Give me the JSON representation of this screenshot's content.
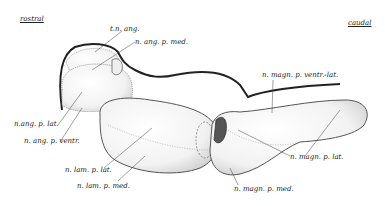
{
  "orientation": {
    "rostral": "rostral",
    "caudal": "caudal"
  },
  "labels": {
    "tn_ang": "t.n. ang.",
    "n_ang_p_med": "n. ang. p. med.",
    "n_ang_p_lat": "n.ang. p. lat.",
    "n_ang_p_ventr": "n. ang. p. ventr.",
    "n_lam_p_lat": "n. lam. p. lat.",
    "n_lam_p_med": "n. lam. p. med.",
    "n_magn_p_ventr_lat": "n. magn. p. ventr.-lat.",
    "n_magn_p_lat": "n. magn. p. lat.",
    "n_magn_p_med": "n. magn. p. med."
  },
  "colors": {
    "outline": "#222222",
    "stipple": "#bdbdbd",
    "background": "#ffffff"
  }
}
